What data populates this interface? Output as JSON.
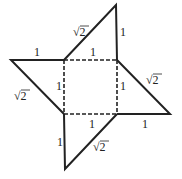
{
  "diagram": {
    "type": "geometric-net",
    "stroke_color": "#222222",
    "square": {
      "corners": {
        "tl": [
          64,
          60
        ],
        "tr": [
          117,
          60
        ],
        "br": [
          117,
          114
        ],
        "bl": [
          64,
          114
        ]
      },
      "style": "dashed"
    },
    "apexes": {
      "top": [
        116,
        5
      ],
      "left": [
        11,
        60
      ],
      "right": [
        170,
        114
      ],
      "bottom": [
        65,
        169
      ]
    },
    "labels": [
      {
        "id": "top-hyp",
        "text": "√2",
        "x": 73,
        "y": 36
      },
      {
        "id": "top-leg",
        "text": "1",
        "x": 120,
        "y": 36
      },
      {
        "id": "left-top-leg",
        "text": "1",
        "x": 34,
        "y": 56
      },
      {
        "id": "square-top",
        "text": "1",
        "x": 90,
        "y": 56
      },
      {
        "id": "right-hyp",
        "text": "√2",
        "x": 146,
        "y": 84
      },
      {
        "id": "left-hyp",
        "text": "√2",
        "x": 14,
        "y": 100
      },
      {
        "id": "square-left",
        "text": "1",
        "x": 56,
        "y": 90
      },
      {
        "id": "square-right",
        "text": "1",
        "x": 120,
        "y": 90
      },
      {
        "id": "square-bottom",
        "text": "1",
        "x": 89,
        "y": 128
      },
      {
        "id": "right-leg",
        "text": "1",
        "x": 142,
        "y": 128
      },
      {
        "id": "bottom-leg",
        "text": "1",
        "x": 57,
        "y": 146
      },
      {
        "id": "bottom-hyp",
        "text": "√2",
        "x": 93,
        "y": 151
      }
    ]
  }
}
